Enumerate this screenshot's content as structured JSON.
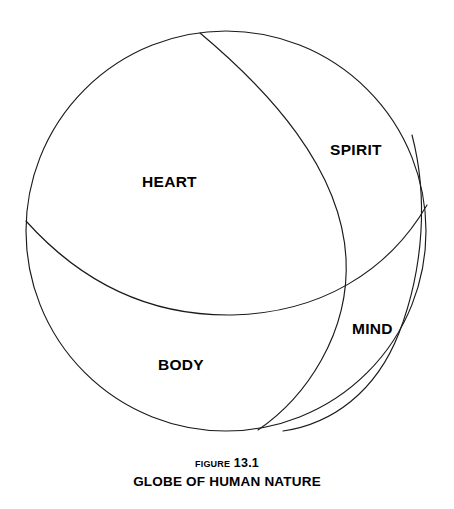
{
  "figure": {
    "caption_label": "Figure 13.1",
    "caption_title": "GLOBE OF HUMAN NATURE",
    "background_color": "#ffffff",
    "line_color": "#1a1a1a",
    "text_color": "#000000"
  },
  "globe": {
    "center_x": 226,
    "center_y": 231,
    "radius": 200,
    "labels": {
      "heart": "HEART",
      "spirit": "SPIRIT",
      "mind": "MIND",
      "body": "BODY"
    }
  },
  "artifact": {
    "bleed_text": ""
  }
}
